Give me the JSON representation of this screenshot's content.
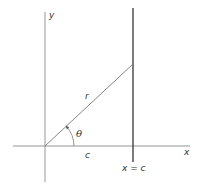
{
  "diagram": {
    "title": "",
    "labels": {
      "y_axis": "y",
      "x_axis": "x",
      "radius": "r",
      "angle": "θ",
      "distance": "c",
      "vertical_line": "x = c"
    },
    "colors": {
      "axis": "#888888",
      "vertical_line": "#444444",
      "radius_line": "#777777",
      "text": "#333333",
      "background": "#ffffff"
    },
    "geometry": {
      "origin": [
        45,
        146
      ],
      "x_axis_range": [
        13,
        190
      ],
      "y_axis_range": [
        12,
        182
      ],
      "vertical_line_x": 133,
      "vertical_line_range": [
        8,
        162
      ],
      "radius_end": [
        133,
        64
      ]
    }
  }
}
